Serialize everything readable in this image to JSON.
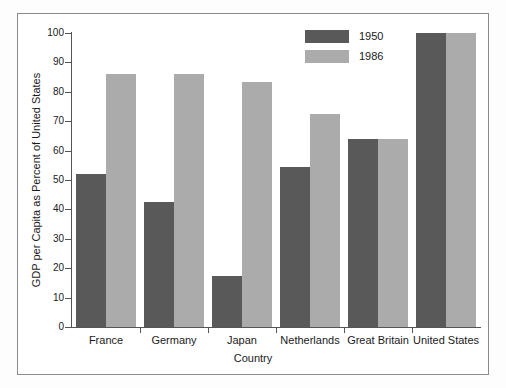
{
  "chart_data": {
    "type": "bar",
    "title": "",
    "xlabel": "Country",
    "ylabel": "GDP per Capita as Percent of United States",
    "categories": [
      "France",
      "Germany",
      "Japan",
      "Netherlands",
      "Great Britain",
      "United States"
    ],
    "series": [
      {
        "name": "1950",
        "color": "#595959",
        "values": [
          52,
          42.5,
          17.5,
          54.5,
          64,
          100
        ]
      },
      {
        "name": "1986",
        "color": "#ababab",
        "values": [
          86,
          86,
          83.5,
          72.5,
          64,
          100
        ]
      }
    ],
    "ylim": [
      0,
      100
    ],
    "yticks": [
      0,
      10,
      20,
      30,
      40,
      50,
      60,
      70,
      80,
      90,
      100
    ],
    "ytick_labels": [
      "0",
      "10",
      "20",
      "30",
      "40",
      "50",
      "60",
      "70",
      "80",
      "90",
      "100"
    ],
    "grid": false,
    "legend_position": "top-center-right",
    "legend_entries": [
      "1950",
      "1986"
    ]
  }
}
